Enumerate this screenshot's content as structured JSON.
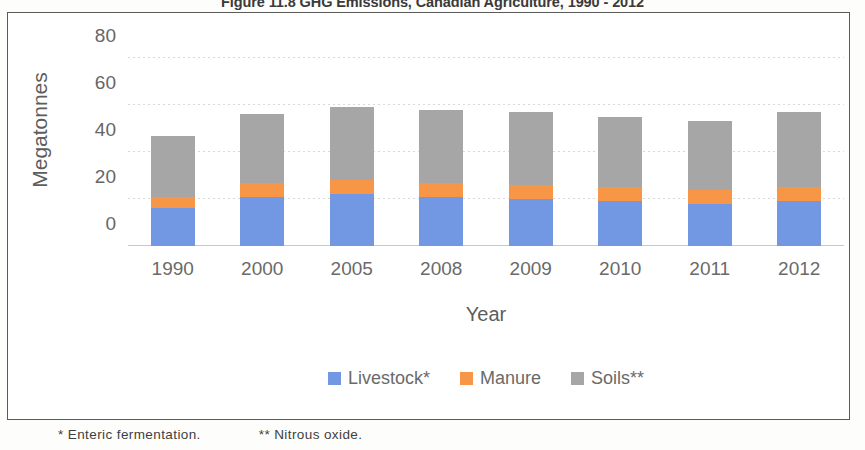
{
  "chart_data": {
    "type": "bar",
    "subtype": "stacked-column",
    "title": "Figure 11.8 GHG Emissions, Canadian Agriculture, 1990 - 2012",
    "xlabel": "Year",
    "ylabel": "Megatonnes",
    "categories": [
      "1990",
      "2000",
      "2005",
      "2008",
      "2009",
      "2010",
      "2011",
      "2012"
    ],
    "ylim": [
      0,
      80
    ],
    "yticks": [
      "0",
      "20",
      "40",
      "60",
      "80"
    ],
    "ytick_values": [
      0,
      20,
      40,
      60,
      80
    ],
    "grid": true,
    "legend_position": "bottom",
    "series": [
      {
        "name": "Livestock*",
        "color": "#7297e3",
        "values": [
          16,
          21,
          22,
          21,
          20,
          19,
          18,
          19
        ]
      },
      {
        "name": "Manure",
        "color": "#f79646",
        "values": [
          5,
          6,
          6,
          6,
          6,
          6,
          6,
          6
        ]
      },
      {
        "name": "Soils**",
        "color": "#a6a6a6",
        "values": [
          26,
          29,
          31,
          31,
          31,
          30,
          29,
          32
        ]
      }
    ],
    "totals": [
      47,
      56,
      59,
      58,
      57,
      55,
      53,
      57
    ],
    "annotations": [
      "* Enteric fermentation.",
      "** Nitrous oxide."
    ]
  },
  "footnotes": {
    "first": "* Enteric fermentation.",
    "second": "** Nitrous oxide."
  }
}
